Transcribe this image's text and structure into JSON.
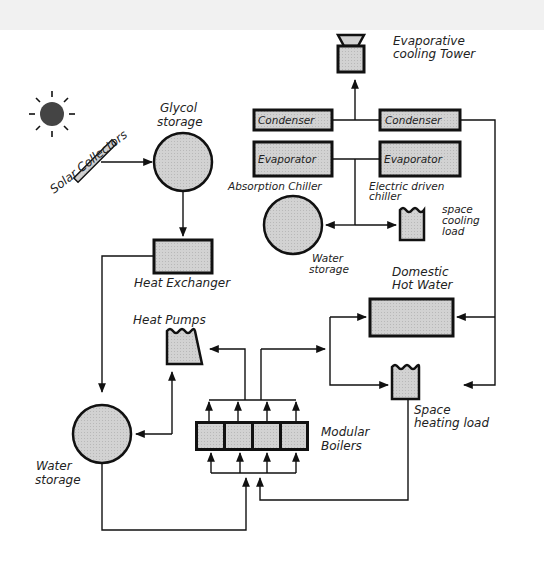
{
  "diagram": {
    "title": "",
    "components": {
      "sun": {
        "label": ""
      },
      "solar_collectors": {
        "label": "Solar Collectors"
      },
      "glycol_storage": {
        "label_line1": "Glycol",
        "label_line2": "storage"
      },
      "heat_exchanger": {
        "label": "Heat  Exchanger"
      },
      "evaporative_cooling_tower": {
        "label_line1": "Evaporative",
        "label_line2": "cooling Tower"
      },
      "condenser_left": {
        "label": "Condenser"
      },
      "condenser_right": {
        "label": "Condenser"
      },
      "evaporator_left": {
        "label": "Evaporator"
      },
      "evaporator_right": {
        "label": "Evaporator"
      },
      "absorption_chiller": {
        "label": "Absorption Chiller"
      },
      "electric_chiller": {
        "label_line1": "Electric driven",
        "label_line2": "chiller"
      },
      "water_storage_cooling": {
        "label_line1": "Water",
        "label_line2": "storage"
      },
      "space_cooling_load": {
        "label_line1": "space",
        "label_line2": "cooling",
        "label_line3": "load"
      },
      "domestic_hot_water": {
        "label_line1": "Domestic",
        "label_line2": "Hot Water"
      },
      "heat_pumps": {
        "label": "Heat  Pumps"
      },
      "water_storage_heating": {
        "label_line1": "Water",
        "label_line2": "storage"
      },
      "modular_boilers": {
        "label_line1": "Modular",
        "label_line2": "Boilers"
      },
      "space_heating_load": {
        "label_line1": "Space",
        "label_line2": "heating load"
      }
    },
    "colors": {
      "fill": "#cfcfcf",
      "stroke": "#111111",
      "sun": "#444444"
    }
  }
}
